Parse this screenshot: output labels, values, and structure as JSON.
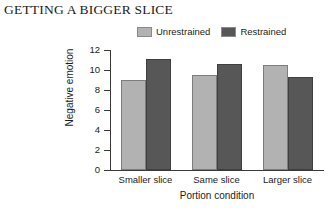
{
  "title": "GETTING A BIGGER SLICE",
  "legend": {
    "position": "top",
    "entries": [
      {
        "label": "Unrestrained",
        "color": "#b2b2b2",
        "swatch_name": "legend-swatch-unrestrained"
      },
      {
        "label": "Restrained",
        "color": "#575757",
        "swatch_name": "legend-swatch-restrained"
      }
    ]
  },
  "chart_data": {
    "type": "bar",
    "title": "GETTING A BIGGER SLICE",
    "xlabel": "Portion condition",
    "ylabel": "Negative emotion",
    "categories": [
      "Smaller slice",
      "Same slice",
      "Larger slice"
    ],
    "series": [
      {
        "name": "Unrestrained",
        "color": "#b2b2b2",
        "values": [
          9.0,
          9.5,
          10.5
        ]
      },
      {
        "name": "Restrained",
        "color": "#575757",
        "values": [
          11.1,
          10.6,
          9.3
        ]
      }
    ],
    "ylim": [
      0,
      12
    ],
    "yticks": [
      0,
      2,
      4,
      6,
      8,
      10,
      12
    ],
    "ytick_labels": [
      "0",
      "2",
      "4",
      "6",
      "8",
      "10",
      "12"
    ],
    "grid": false,
    "legend_position": "top"
  }
}
